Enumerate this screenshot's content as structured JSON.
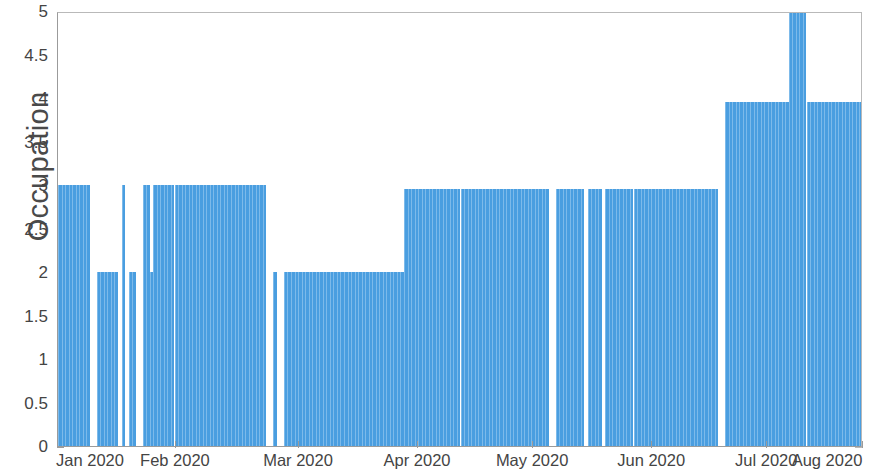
{
  "chart_data": {
    "type": "bar",
    "title": "",
    "subtitle": "",
    "xlabel": "",
    "ylabel": "Occupation",
    "ylim": [
      0,
      5
    ],
    "yticks": [
      0,
      0.5,
      1,
      1.5,
      2,
      2.5,
      3,
      3.5,
      4,
      4.5,
      5
    ],
    "ytick_labels": [
      "0",
      "0.5",
      "1",
      "1.5",
      "2",
      "2.5",
      "3",
      "3.5",
      "4",
      "4.5",
      "5"
    ],
    "xtick_labels": [
      "Jan 2020",
      "Feb 2020",
      "Mar 2020",
      "Apr 2020",
      "May 2020",
      "Jun 2020",
      "Jul 2020",
      "Aug 2020"
    ],
    "xtick_positions_frac": [
      0.0,
      0.1465,
      0.2994,
      0.4473,
      0.5902,
      0.7381,
      0.8811,
      1.0
    ],
    "x_axis_type": "date",
    "x_range": [
      "2020-01-01",
      "2020-08-01"
    ],
    "grid": false,
    "legend": false,
    "series_name": "Occupation",
    "bar_color": "#4a9ee0",
    "bar_edge_color": "#7dbaea",
    "axis_color": "#9b9b9b",
    "text_color": "#444444",
    "n_bars": 214,
    "note": "Daily occupancy counts; zero-height days appear as white gaps.",
    "values": [
      3,
      3,
      3,
      3,
      3,
      3,
      3,
      3,
      3,
      0,
      0,
      2,
      2,
      2,
      2,
      2,
      2,
      0,
      3,
      0,
      2,
      2,
      0,
      0,
      3,
      3,
      2,
      3,
      3,
      3,
      3,
      3,
      3,
      3,
      3,
      3,
      3,
      3,
      3,
      3,
      3,
      3,
      3,
      3,
      3,
      3,
      3,
      3,
      3,
      3,
      3,
      3,
      3,
      3,
      3,
      3,
      3,
      3,
      3,
      0,
      0,
      2,
      0,
      0,
      2,
      2,
      2,
      2,
      2,
      2,
      2,
      2,
      2,
      2,
      2,
      2,
      2,
      2,
      2,
      2,
      2,
      2,
      2,
      2,
      2,
      2,
      2,
      2,
      2,
      2,
      2,
      2,
      2,
      2,
      2,
      2,
      2,
      2,
      2.95,
      2.95,
      2.95,
      2.95,
      2.95,
      2.95,
      2.95,
      2.95,
      2.95,
      2.95,
      2.95,
      2.95,
      2.95,
      2.95,
      2.95,
      2.95,
      2.95,
      2.95,
      2.95,
      2.95,
      2.95,
      2.95,
      2.95,
      2.95,
      2.95,
      2.95,
      2.95,
      2.95,
      2.95,
      2.95,
      2.95,
      2.95,
      2.95,
      2.95,
      2.95,
      2.95,
      2.95,
      2.95,
      2.95,
      2.95,
      2.95,
      0,
      0,
      2.95,
      2.95,
      2.95,
      2.95,
      2.95,
      2.95,
      2.95,
      2.95,
      0,
      2.95,
      2.95,
      2.95,
      2.95,
      0,
      2.95,
      2.95,
      2.95,
      2.95,
      2.95,
      2.95,
      2.95,
      2.95,
      2.95,
      2.95,
      2.95,
      2.95,
      2.95,
      2.95,
      2.95,
      2.95,
      2.95,
      2.95,
      2.95,
      2.95,
      2.95,
      2.95,
      2.95,
      2.95,
      2.95,
      2.95,
      2.95,
      2.95,
      2.95,
      2.95,
      2.95,
      2.95,
      0,
      0,
      3.95,
      3.95,
      3.95,
      3.95,
      3.95,
      3.95,
      3.95,
      3.95,
      3.95,
      3.95,
      3.95,
      3.95,
      3.95,
      3.95,
      3.95,
      3.95,
      3.95,
      3.95,
      5,
      5,
      5,
      5,
      5,
      3.95,
      3.95,
      3.95,
      3.95,
      3.95,
      3.95,
      3.95,
      3.95,
      3.95,
      3.95,
      3.95,
      3.95,
      3.95,
      3.95,
      3.95,
      3.95
    ]
  }
}
